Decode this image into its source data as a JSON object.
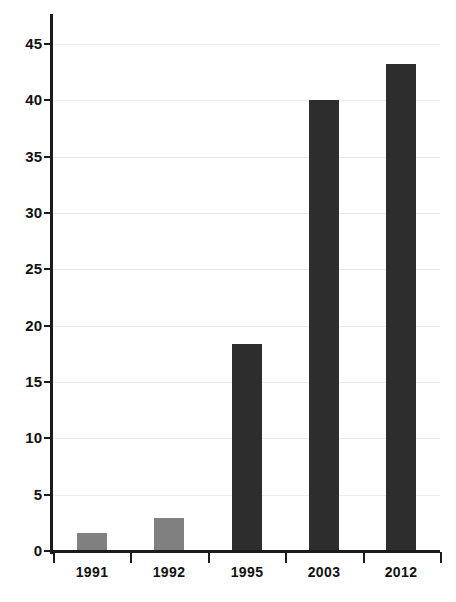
{
  "chart_data": {
    "type": "bar",
    "title": "",
    "subtitle": "",
    "xlabel": "",
    "ylabel": "",
    "categories": [
      "1991",
      "1992",
      "1995",
      "2003",
      "2012"
    ],
    "values": [
      1.6,
      2.9,
      18.4,
      40.0,
      43.2
    ],
    "series": [
      {
        "name": "",
        "values": [
          1.6,
          2.9,
          18.4,
          40.0,
          43.2
        ]
      }
    ],
    "ylim": [
      0,
      47
    ],
    "yticks": [
      0,
      5,
      10,
      15,
      20,
      25,
      30,
      35,
      40,
      45
    ],
    "ytick_labels": [
      "0",
      "5",
      "10",
      "15",
      "20",
      "25",
      "30",
      "35",
      "40",
      "45"
    ],
    "grid": true,
    "legend": false,
    "legend_position": "none",
    "bar_colors": [
      "#808080",
      "#808080",
      "#2d2d2d",
      "#2d2d2d",
      "#2d2d2d"
    ],
    "annotations": []
  },
  "style": {
    "background": "#ffffff",
    "axis_color": "#1b1b1b",
    "grid_color": "#ececec",
    "light_bar_color": "#808080",
    "dark_bar_color": "#2d2d2d",
    "tick_text_color": "#111111"
  }
}
